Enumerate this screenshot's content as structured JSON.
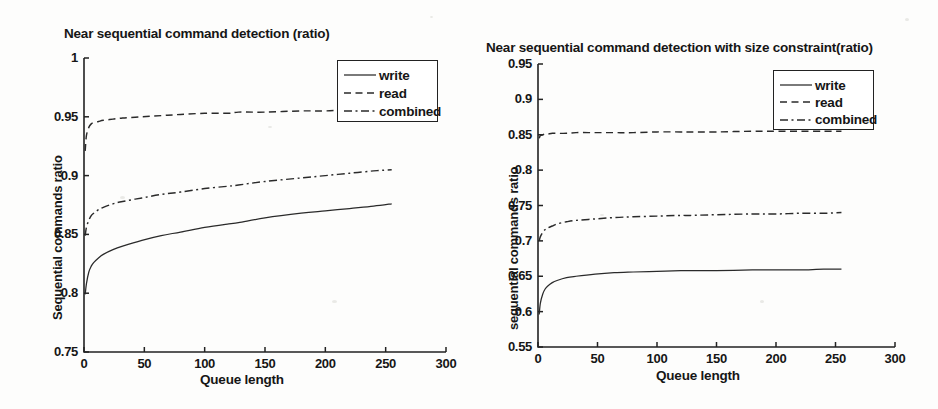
{
  "figure": {
    "background_color": "#fdfdfc",
    "ink_color": "#2a2a2a"
  },
  "panels": [
    {
      "id": "left",
      "title": "Near sequential command detection (ratio)",
      "xlabel": "Queue length",
      "ylabel": "Sequential commands ratio",
      "xticks": [
        "0",
        "50",
        "100",
        "150",
        "200",
        "250",
        "300"
      ],
      "yticks": [
        "0.75",
        "0.8",
        "0.85",
        "0.9",
        "0.95",
        "1"
      ],
      "legend": [
        "write",
        "read",
        "combined"
      ]
    },
    {
      "id": "right",
      "title": "Near sequential command detection with size constraint(ratio)",
      "xlabel": "Queue length",
      "ylabel": "sequential commands ratio",
      "xticks": [
        "0",
        "50",
        "100",
        "150",
        "200",
        "250",
        "300"
      ],
      "yticks": [
        "0.55",
        "0.6",
        "0.65",
        "0.7",
        "0.75",
        "0.8",
        "0.85",
        "0.9",
        "0.95"
      ],
      "legend": [
        "write",
        "read",
        "combined"
      ]
    }
  ],
  "chart_data": [
    {
      "type": "line",
      "panel": "left",
      "title": "Near sequential command detection (ratio)",
      "xlabel": "Queue length",
      "ylabel": "Sequential commands ratio",
      "xlim": [
        0,
        300
      ],
      "ylim": [
        0.75,
        1.0
      ],
      "xticks": [
        0,
        50,
        100,
        150,
        200,
        250,
        300
      ],
      "yticks": [
        0.75,
        0.8,
        0.85,
        0.9,
        0.95,
        1.0
      ],
      "grid": false,
      "legend_position": "upper right",
      "x": [
        1,
        2,
        4,
        6,
        8,
        12,
        16,
        24,
        32,
        48,
        64,
        80,
        100,
        120,
        128,
        150,
        180,
        200,
        220,
        240,
        255
      ],
      "series": [
        {
          "name": "write",
          "style": "solid",
          "values": [
            0.799,
            0.808,
            0.818,
            0.823,
            0.826,
            0.83,
            0.833,
            0.837,
            0.84,
            0.845,
            0.849,
            0.852,
            0.856,
            0.859,
            0.86,
            0.864,
            0.868,
            0.87,
            0.872,
            0.874,
            0.876
          ]
        },
        {
          "name": "read",
          "style": "dashed",
          "values": [
            0.921,
            0.934,
            0.941,
            0.944,
            0.945,
            0.946,
            0.947,
            0.948,
            0.949,
            0.95,
            0.951,
            0.952,
            0.953,
            0.953,
            0.954,
            0.954,
            0.955,
            0.955,
            0.956,
            0.956,
            0.956
          ]
        },
        {
          "name": "combined",
          "style": "dashdot",
          "values": [
            0.849,
            0.856,
            0.862,
            0.866,
            0.868,
            0.871,
            0.873,
            0.876,
            0.878,
            0.881,
            0.884,
            0.886,
            0.889,
            0.891,
            0.892,
            0.895,
            0.898,
            0.9,
            0.902,
            0.904,
            0.905
          ]
        }
      ]
    },
    {
      "type": "line",
      "panel": "right",
      "title": "Near sequential command detection with size constraint(ratio)",
      "xlabel": "Queue length",
      "ylabel": "sequential commands ratio",
      "xlim": [
        0,
        300
      ],
      "ylim": [
        0.55,
        0.95
      ],
      "xticks": [
        0,
        50,
        100,
        150,
        200,
        250,
        300
      ],
      "yticks": [
        0.55,
        0.6,
        0.65,
        0.7,
        0.75,
        0.8,
        0.85,
        0.9,
        0.95
      ],
      "grid": false,
      "legend_position": "upper right",
      "x": [
        1,
        2,
        4,
        6,
        8,
        12,
        16,
        24,
        32,
        48,
        64,
        80,
        100,
        120,
        128,
        150,
        180,
        200,
        220,
        240,
        255
      ],
      "series": [
        {
          "name": "write",
          "style": "solid",
          "values": [
            0.596,
            0.612,
            0.625,
            0.632,
            0.636,
            0.641,
            0.644,
            0.648,
            0.65,
            0.653,
            0.655,
            0.656,
            0.657,
            0.658,
            0.658,
            0.658,
            0.659,
            0.659,
            0.659,
            0.66,
            0.66
          ]
        },
        {
          "name": "read",
          "style": "dashed",
          "values": [
            0.845,
            0.849,
            0.85,
            0.851,
            0.851,
            0.852,
            0.852,
            0.852,
            0.853,
            0.853,
            0.853,
            0.853,
            0.854,
            0.854,
            0.854,
            0.854,
            0.855,
            0.855,
            0.855,
            0.855,
            0.855
          ]
        },
        {
          "name": "combined",
          "style": "dashdot",
          "values": [
            0.7,
            0.706,
            0.712,
            0.716,
            0.718,
            0.721,
            0.724,
            0.727,
            0.729,
            0.731,
            0.733,
            0.734,
            0.735,
            0.736,
            0.736,
            0.737,
            0.738,
            0.738,
            0.739,
            0.739,
            0.74
          ]
        }
      ]
    }
  ]
}
